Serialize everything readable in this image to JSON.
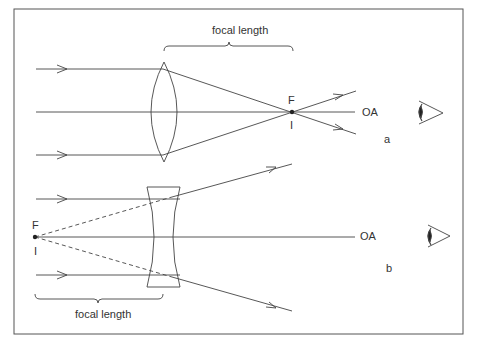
{
  "diagram": {
    "panel_a": {
      "id_label": "a",
      "lens_type": "convex-lens",
      "focal_label": "focal length",
      "focus_label": "F",
      "image_label": "I",
      "axis_label": "OA"
    },
    "panel_b": {
      "id_label": "b",
      "lens_type": "concave-lens",
      "focal_label": "focal length",
      "focus_label": "F",
      "image_label": "I",
      "axis_label": "OA"
    },
    "colors": {
      "line": "#444444",
      "frame": "#555555",
      "background": "#ffffff"
    }
  }
}
